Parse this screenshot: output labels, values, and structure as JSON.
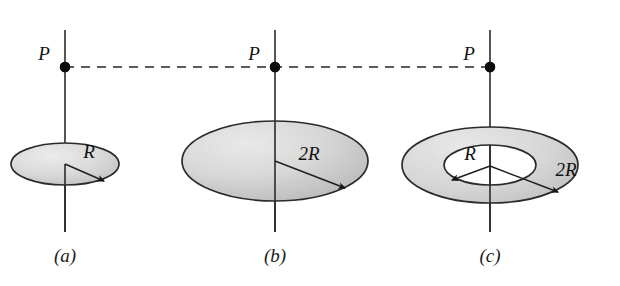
{
  "figure": {
    "background_color": "#ffffff",
    "width": 620,
    "height": 286
  },
  "style": {
    "disk_fill_light": "#e6e6e6",
    "disk_fill_mid": "#d2d2d2",
    "disk_fill_dark": "#bcbcbc",
    "outline_color": "#2b2b2b",
    "axis_color": "#2b2b2b",
    "dash_color": "#5a5a5a",
    "dot_color": "#0d0d0d",
    "text_color": "#111111",
    "hole_fill": "#ffffff"
  },
  "panels": [
    {
      "id": "a",
      "caption": "(a)",
      "caption_x": 65,
      "caption_y": 262,
      "point_label": "P",
      "point_label_x": 44,
      "point_label_y": 60,
      "point_x": 65,
      "point_y": 67,
      "axis_x": 65,
      "axis_top": 30,
      "axis_bottom": 232,
      "shape": "disk",
      "center_x": 65,
      "center_y": 164,
      "outer_rx": 54,
      "outer_ry": 21,
      "inner_rx": 0,
      "inner_ry": 0,
      "radii": [
        {
          "label": "R",
          "label_x": 89,
          "label_y": 158,
          "from_x": 65,
          "from_y": 164,
          "to_x": 104,
          "to_y": 181,
          "direction": "down-right"
        }
      ]
    },
    {
      "id": "b",
      "caption": "(b)",
      "caption_x": 275,
      "caption_y": 262,
      "point_label": "P",
      "point_label_x": 254,
      "point_label_y": 60,
      "point_x": 275,
      "point_y": 67,
      "axis_x": 275,
      "axis_top": 30,
      "axis_bottom": 232,
      "shape": "disk",
      "center_x": 275,
      "center_y": 161,
      "outer_rx": 93,
      "outer_ry": 40,
      "inner_rx": 0,
      "inner_ry": 0,
      "radii": [
        {
          "label": "2R",
          "label_x": 304,
          "label_y": 160,
          "from_x": 275,
          "from_y": 161,
          "to_x": 345,
          "to_y": 188,
          "direction": "down-right"
        }
      ]
    },
    {
      "id": "c",
      "caption": "(c)",
      "caption_x": 490,
      "caption_y": 262,
      "point_label": "P",
      "point_label_x": 469,
      "point_label_y": 60,
      "point_x": 490,
      "point_y": 67,
      "axis_x": 490,
      "axis_top": 30,
      "axis_bottom": 232,
      "shape": "annulus",
      "center_x": 490,
      "center_y": 165,
      "outer_rx": 88,
      "outer_ry": 38,
      "inner_rx": 46,
      "inner_ry": 20,
      "radii": [
        {
          "label": "R",
          "label_x": 489,
          "label_y": 158,
          "from_x": 490,
          "from_y": 166,
          "to_x": 452,
          "to_y": 180,
          "direction": "down-left"
        },
        {
          "label": "2R",
          "label_x": 562,
          "label_y": 176,
          "from_x": 490,
          "from_y": 166,
          "to_x": 558,
          "to_y": 192,
          "direction": "down-right"
        }
      ]
    }
  ],
  "connector": {
    "name": "horizontal-dashed-guide",
    "y": 67,
    "x_start": 65,
    "x_end": 490
  }
}
